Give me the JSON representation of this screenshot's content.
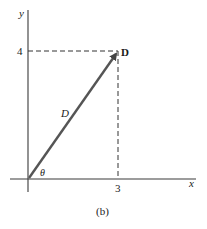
{
  "figure": {
    "caption": "(b)",
    "axes": {
      "x_label": "x",
      "y_label": "y",
      "x_tick": "3",
      "y_tick": "4"
    },
    "vector": {
      "name_bold": "D",
      "magnitude_label": "D",
      "angle_label": "θ",
      "components": {
        "x": 3,
        "y": 4
      }
    },
    "colors": {
      "axis": "#3a3a3a",
      "vector": "#555555",
      "dashed": "#333333",
      "text": "#1a1a1a"
    }
  }
}
